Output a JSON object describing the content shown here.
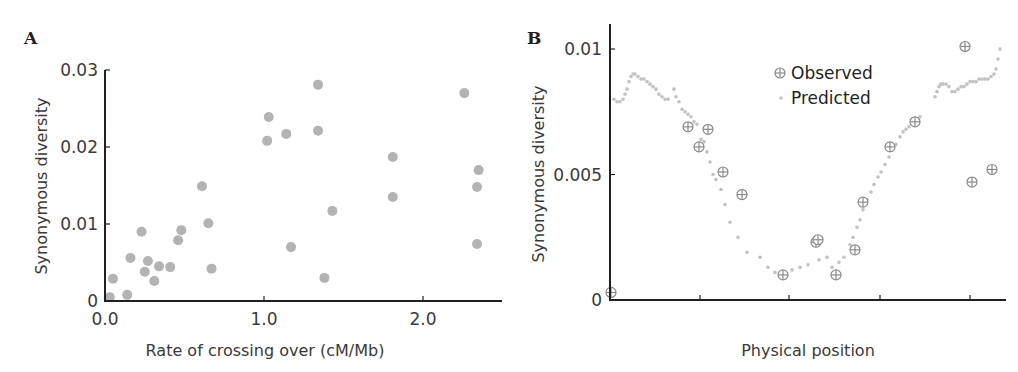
{
  "chart_data": [
    {
      "panel": "A",
      "type": "scatter",
      "title": "",
      "xlabel": "Rate of crossing over (cM/Mb)",
      "ylabel": "Synonymous diversity",
      "xlim": [
        0.0,
        2.5
      ],
      "ylim": [
        0,
        0.03
      ],
      "xticks": [
        0.0,
        1.0,
        2.0
      ],
      "xtick_labels": [
        "0.0",
        "1.0",
        "2.0"
      ],
      "yticks": [
        0,
        0.01,
        0.02,
        0.03
      ],
      "ytick_labels": [
        "0",
        "0.01",
        "0.02",
        "0.03"
      ],
      "grid": false,
      "marker_color": "#b3b3b3",
      "points": [
        {
          "x": 0.03,
          "y": 0.0005
        },
        {
          "x": 0.05,
          "y": 0.0029
        },
        {
          "x": 0.14,
          "y": 0.0008
        },
        {
          "x": 0.16,
          "y": 0.0056
        },
        {
          "x": 0.23,
          "y": 0.009
        },
        {
          "x": 0.25,
          "y": 0.0038
        },
        {
          "x": 0.27,
          "y": 0.0052
        },
        {
          "x": 0.31,
          "y": 0.0026
        },
        {
          "x": 0.34,
          "y": 0.0045
        },
        {
          "x": 0.41,
          "y": 0.0044
        },
        {
          "x": 0.46,
          "y": 0.0079
        },
        {
          "x": 0.48,
          "y": 0.0092
        },
        {
          "x": 0.61,
          "y": 0.0149
        },
        {
          "x": 0.65,
          "y": 0.0101
        },
        {
          "x": 0.67,
          "y": 0.0042
        },
        {
          "x": 1.02,
          "y": 0.0208
        },
        {
          "x": 1.03,
          "y": 0.0239
        },
        {
          "x": 1.14,
          "y": 0.0217
        },
        {
          "x": 1.17,
          "y": 0.007
        },
        {
          "x": 1.34,
          "y": 0.0281
        },
        {
          "x": 1.34,
          "y": 0.0221
        },
        {
          "x": 1.38,
          "y": 0.003
        },
        {
          "x": 1.43,
          "y": 0.0117
        },
        {
          "x": 1.81,
          "y": 0.0187
        },
        {
          "x": 1.81,
          "y": 0.0135
        },
        {
          "x": 2.26,
          "y": 0.027
        },
        {
          "x": 2.35,
          "y": 0.017
        },
        {
          "x": 2.34,
          "y": 0.0148
        },
        {
          "x": 2.34,
          "y": 0.0074
        }
      ]
    },
    {
      "panel": "B",
      "type": "scatter",
      "title": "",
      "xlabel": "Physical position",
      "ylabel": "Synonymous diversity",
      "xlim": [
        0,
        396
      ],
      "ylim": [
        0,
        0.01
      ],
      "xticks": [
        90,
        179,
        270,
        360
      ],
      "xtick_labels": [
        "",
        "",
        "",
        ""
      ],
      "yticks": [
        0,
        0.005,
        0.01
      ],
      "ytick_labels": [
        "0",
        "0.005",
        "0.01"
      ],
      "grid": false,
      "legend": {
        "position": "upper-center",
        "entries": [
          "Observed",
          "Predicted"
        ]
      },
      "series": [
        {
          "name": "Observed",
          "marker": "circle-plus",
          "color": "#8a8a8a",
          "points": [
            {
              "x": 1,
              "y": 0.0003
            },
            {
              "x": 78,
              "y": 0.0069
            },
            {
              "x": 89,
              "y": 0.0061
            },
            {
              "x": 98,
              "y": 0.0068
            },
            {
              "x": 113,
              "y": 0.0051
            },
            {
              "x": 132,
              "y": 0.0042
            },
            {
              "x": 173,
              "y": 0.001
            },
            {
              "x": 206,
              "y": 0.0023
            },
            {
              "x": 208,
              "y": 0.0024
            },
            {
              "x": 226,
              "y": 0.001
            },
            {
              "x": 245,
              "y": 0.002
            },
            {
              "x": 253,
              "y": 0.0039
            },
            {
              "x": 280,
              "y": 0.0061
            },
            {
              "x": 305,
              "y": 0.0071
            },
            {
              "x": 355,
              "y": 0.0101
            },
            {
              "x": 362,
              "y": 0.0047
            },
            {
              "x": 382,
              "y": 0.0052
            }
          ]
        },
        {
          "name": "Predicted",
          "marker": "dot",
          "color": "#c2c2c2",
          "points": [
            {
              "x": 4,
              "y": 0.008
            },
            {
              "x": 7,
              "y": 0.0079
            },
            {
              "x": 10,
              "y": 0.0079
            },
            {
              "x": 13,
              "y": 0.008
            },
            {
              "x": 15,
              "y": 0.0082
            },
            {
              "x": 17,
              "y": 0.0084
            },
            {
              "x": 19,
              "y": 0.0087
            },
            {
              "x": 21,
              "y": 0.0089
            },
            {
              "x": 23,
              "y": 0.009
            },
            {
              "x": 25,
              "y": 0.009
            },
            {
              "x": 28,
              "y": 0.0089
            },
            {
              "x": 31,
              "y": 0.0088
            },
            {
              "x": 34,
              "y": 0.0088
            },
            {
              "x": 37,
              "y": 0.0087
            },
            {
              "x": 40,
              "y": 0.0086
            },
            {
              "x": 43,
              "y": 0.0085
            },
            {
              "x": 46,
              "y": 0.0084
            },
            {
              "x": 49,
              "y": 0.0082
            },
            {
              "x": 52,
              "y": 0.0081
            },
            {
              "x": 55,
              "y": 0.008
            },
            {
              "x": 58,
              "y": 0.008
            },
            {
              "x": 64,
              "y": 0.0084
            },
            {
              "x": 66,
              "y": 0.0081
            },
            {
              "x": 69,
              "y": 0.0079
            },
            {
              "x": 72,
              "y": 0.0076
            },
            {
              "x": 75,
              "y": 0.0075
            },
            {
              "x": 78,
              "y": 0.0074
            },
            {
              "x": 81,
              "y": 0.0073
            },
            {
              "x": 84,
              "y": 0.0071
            },
            {
              "x": 87,
              "y": 0.007
            },
            {
              "x": 91,
              "y": 0.0064
            },
            {
              "x": 94,
              "y": 0.0063
            },
            {
              "x": 97,
              "y": 0.0059
            },
            {
              "x": 100,
              "y": 0.0055
            },
            {
              "x": 103,
              "y": 0.005
            },
            {
              "x": 106,
              "y": 0.0048
            },
            {
              "x": 111,
              "y": 0.0044
            },
            {
              "x": 115,
              "y": 0.0038
            },
            {
              "x": 120,
              "y": 0.0031
            },
            {
              "x": 128,
              "y": 0.0025
            },
            {
              "x": 137,
              "y": 0.0019
            },
            {
              "x": 150,
              "y": 0.0017
            },
            {
              "x": 158,
              "y": 0.0013
            },
            {
              "x": 165,
              "y": 0.0011
            },
            {
              "x": 182,
              "y": 0.0012
            },
            {
              "x": 190,
              "y": 0.0013
            },
            {
              "x": 198,
              "y": 0.0014
            },
            {
              "x": 209,
              "y": 0.0016
            },
            {
              "x": 217,
              "y": 0.0017
            },
            {
              "x": 222,
              "y": 0.0013
            },
            {
              "x": 229,
              "y": 0.0015
            },
            {
              "x": 234,
              "y": 0.0017
            },
            {
              "x": 240,
              "y": 0.0022
            },
            {
              "x": 243,
              "y": 0.0025
            },
            {
              "x": 247,
              "y": 0.0029
            },
            {
              "x": 250,
              "y": 0.0032
            },
            {
              "x": 253,
              "y": 0.0036
            },
            {
              "x": 257,
              "y": 0.004
            },
            {
              "x": 261,
              "y": 0.0043
            },
            {
              "x": 264,
              "y": 0.0046
            },
            {
              "x": 268,
              "y": 0.0049
            },
            {
              "x": 271,
              "y": 0.0051
            },
            {
              "x": 275,
              "y": 0.0054
            },
            {
              "x": 279,
              "y": 0.0057
            },
            {
              "x": 283,
              "y": 0.006
            },
            {
              "x": 286,
              "y": 0.0062
            },
            {
              "x": 290,
              "y": 0.0065
            },
            {
              "x": 293,
              "y": 0.0067
            },
            {
              "x": 296,
              "y": 0.0068
            },
            {
              "x": 299,
              "y": 0.0069
            },
            {
              "x": 302,
              "y": 0.007
            },
            {
              "x": 306,
              "y": 0.0071
            },
            {
              "x": 310,
              "y": 0.0073
            },
            {
              "x": 325,
              "y": 0.0081
            },
            {
              "x": 327,
              "y": 0.0083
            },
            {
              "x": 329,
              "y": 0.0085
            },
            {
              "x": 331,
              "y": 0.0086
            },
            {
              "x": 333,
              "y": 0.0086
            },
            {
              "x": 336,
              "y": 0.0086
            },
            {
              "x": 339,
              "y": 0.0085
            },
            {
              "x": 342,
              "y": 0.0083
            },
            {
              "x": 345,
              "y": 0.0083
            },
            {
              "x": 348,
              "y": 0.0084
            },
            {
              "x": 351,
              "y": 0.0085
            },
            {
              "x": 354,
              "y": 0.0085
            },
            {
              "x": 357,
              "y": 0.0086
            },
            {
              "x": 360,
              "y": 0.0087
            },
            {
              "x": 363,
              "y": 0.0087
            },
            {
              "x": 366,
              "y": 0.0087
            },
            {
              "x": 369,
              "y": 0.0088
            },
            {
              "x": 372,
              "y": 0.0088
            },
            {
              "x": 375,
              "y": 0.0088
            },
            {
              "x": 378,
              "y": 0.0088
            },
            {
              "x": 381,
              "y": 0.0089
            },
            {
              "x": 384,
              "y": 0.009
            },
            {
              "x": 386,
              "y": 0.0092
            },
            {
              "x": 388,
              "y": 0.0096
            },
            {
              "x": 390,
              "y": 0.01
            }
          ]
        }
      ]
    }
  ],
  "labels": {
    "panelA": "A",
    "panelB": "B",
    "a_xlabel": "Rate of crossing over (cM/Mb)",
    "a_ylabel": "Synonymous diversity",
    "b_xlabel": "Physical position",
    "b_ylabel": "Synonymous diversity",
    "legend_observed": "Observed",
    "legend_predicted": "Predicted"
  }
}
